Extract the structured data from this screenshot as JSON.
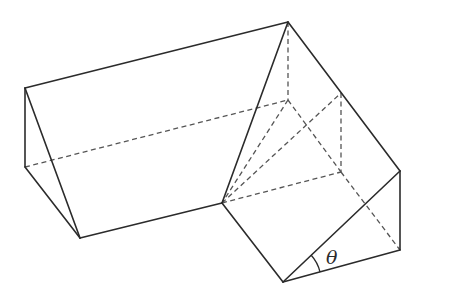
{
  "figure": {
    "angle_label": "θ",
    "colors": {
      "line": "#2b2b2b",
      "hidden_line": "#555555",
      "background": "#ffffff"
    },
    "vertices": {
      "A": [
        25,
        88
      ],
      "B": [
        288,
        22
      ],
      "C": [
        25,
        167
      ],
      "D": [
        80,
        238
      ],
      "E": [
        222,
        203
      ],
      "F": [
        288,
        100
      ],
      "G": [
        341,
        93
      ],
      "H": [
        400,
        171
      ],
      "I": [
        341,
        172
      ],
      "J": [
        400,
        250
      ],
      "K": [
        283,
        282
      ]
    },
    "solid_edges": [
      [
        "A",
        "B"
      ],
      [
        "A",
        "C"
      ],
      [
        "A",
        "D"
      ],
      [
        "C",
        "D"
      ],
      [
        "D",
        "E"
      ],
      [
        "E",
        "B"
      ],
      [
        "B",
        "H"
      ],
      [
        "H",
        "J"
      ],
      [
        "J",
        "K"
      ],
      [
        "K",
        "E"
      ],
      [
        "K",
        "H"
      ]
    ],
    "hidden_edges": [
      [
        "C",
        "F"
      ],
      [
        "F",
        "B"
      ],
      [
        "F",
        "E"
      ],
      [
        "F",
        "I"
      ],
      [
        "E",
        "G"
      ],
      [
        "G",
        "I"
      ],
      [
        "E",
        "I"
      ],
      [
        "I",
        "J"
      ]
    ]
  }
}
